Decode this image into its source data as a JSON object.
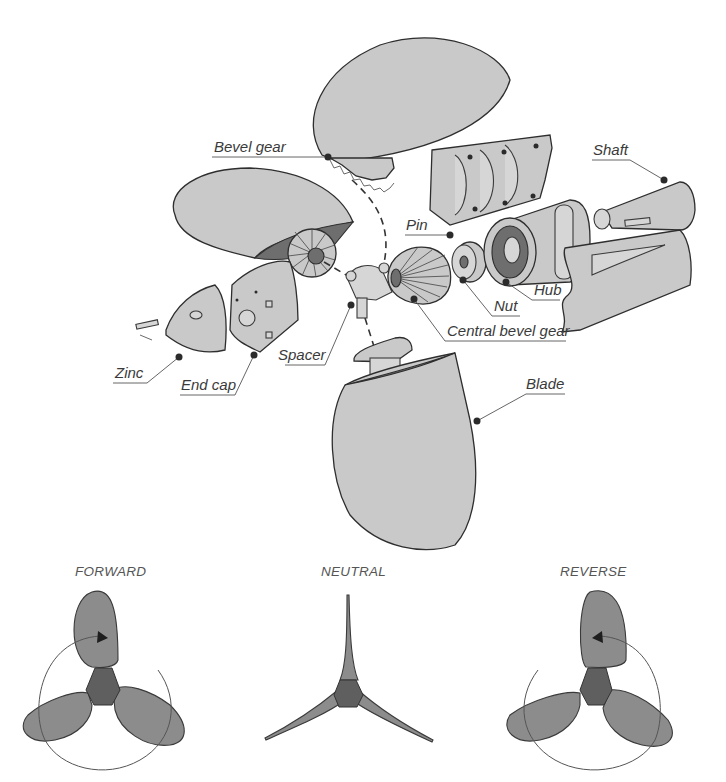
{
  "diagram": {
    "type": "exploded-view",
    "part_labels": [
      {
        "id": "bevel-gear",
        "text": "Bevel gear"
      },
      {
        "id": "shaft",
        "text": "Shaft"
      },
      {
        "id": "pin",
        "text": "Pin"
      },
      {
        "id": "nut",
        "text": "Nut"
      },
      {
        "id": "hub",
        "text": "Hub"
      },
      {
        "id": "central-bevel-gear",
        "text": "Central bevel gear"
      },
      {
        "id": "spacer",
        "text": "Spacer"
      },
      {
        "id": "zinc",
        "text": "Zinc"
      },
      {
        "id": "end-cap",
        "text": "End cap"
      },
      {
        "id": "blade",
        "text": "Blade"
      }
    ],
    "modes": [
      {
        "id": "forward",
        "label": "FORWARD"
      },
      {
        "id": "neutral",
        "label": "NEUTRAL"
      },
      {
        "id": "reverse",
        "label": "REVERSE"
      }
    ],
    "colors": {
      "part_fill": "#c9c9c9",
      "outline": "#2e2e2e",
      "shadow": "#6e6e6e",
      "prop_blade": "#8c8c8c",
      "prop_hub": "#5f5f5f",
      "label_text": "#3a3a3a"
    }
  }
}
